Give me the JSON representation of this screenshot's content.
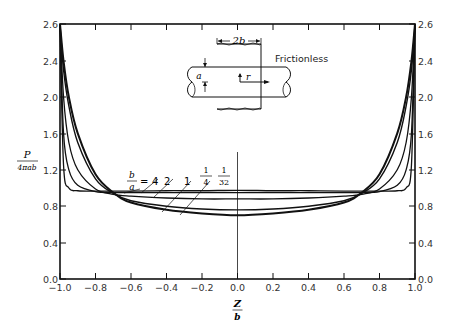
{
  "chart_data": {
    "type": "line",
    "title": "",
    "xlabel": "Z/b",
    "ylabel": "P/(4πab)",
    "xlim": [
      -1.0,
      1.0
    ],
    "ylim": [
      0.0,
      2.6
    ],
    "x_ticks": [
      "-1.0",
      "-0.8",
      "-0.6",
      "-0.4",
      "-0.2",
      "0.0",
      "0.2",
      "0.4",
      "0.6",
      "0.8",
      "1.0"
    ],
    "y_ticks": [
      "0.0",
      "0.4",
      "0.8",
      "1.2",
      "1.6",
      "2.0",
      "2.4",
      "2.6"
    ],
    "grid": false,
    "inset": {
      "label": "Frictionless",
      "width_label": "2b",
      "radius_label": "a",
      "r_label": "r"
    },
    "legend": {
      "prefix_num": "b",
      "prefix_den": "a",
      "entries": [
        "4",
        "2",
        "1",
        "1/4",
        "1/32"
      ]
    },
    "x": [
      -1.0,
      -0.98,
      -0.95,
      -0.9,
      -0.8,
      -0.7,
      -0.6,
      -0.4,
      -0.2,
      0.0,
      0.2,
      0.4,
      0.6,
      0.7,
      0.8,
      0.9,
      0.95,
      0.98,
      1.0
    ],
    "series": [
      {
        "name": "b/a = 4",
        "values": [
          2.6,
          1.25,
          1.0,
          0.97,
          0.965,
          0.965,
          0.965,
          0.97,
          0.97,
          0.975,
          0.97,
          0.97,
          0.965,
          0.965,
          0.965,
          0.97,
          1.0,
          1.25,
          2.6
        ]
      },
      {
        "name": "b/a = 2",
        "values": [
          2.6,
          1.6,
          1.2,
          1.03,
          0.96,
          0.95,
          0.95,
          0.95,
          0.95,
          0.95,
          0.95,
          0.95,
          0.95,
          0.95,
          0.96,
          1.03,
          1.2,
          1.6,
          2.6
        ]
      },
      {
        "name": "b/a = 1",
        "values": [
          2.6,
          2.0,
          1.5,
          1.2,
          0.99,
          0.93,
          0.91,
          0.89,
          0.88,
          0.88,
          0.88,
          0.89,
          0.91,
          0.93,
          0.99,
          1.2,
          1.5,
          2.0,
          2.6
        ]
      },
      {
        "name": "b/a = 1/4",
        "values": [
          2.6,
          2.3,
          1.9,
          1.5,
          1.1,
          0.94,
          0.86,
          0.8,
          0.77,
          0.76,
          0.77,
          0.8,
          0.86,
          0.94,
          1.1,
          1.5,
          1.9,
          2.3,
          2.6
        ]
      },
      {
        "name": "b/a = 1/32",
        "values": [
          2.6,
          2.4,
          2.0,
          1.6,
          1.15,
          0.95,
          0.84,
          0.76,
          0.72,
          0.7,
          0.72,
          0.76,
          0.84,
          0.95,
          1.15,
          1.6,
          2.0,
          2.4,
          2.6
        ]
      }
    ]
  }
}
